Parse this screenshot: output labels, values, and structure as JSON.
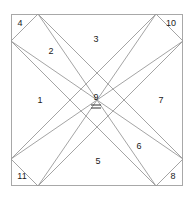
{
  "figure": {
    "background_color": "#ffffff",
    "frame": {
      "stroke_color": "#a8a8a8",
      "fill_color": "#ffffff",
      "x": 11,
      "y": 14,
      "width": 172,
      "height": 172
    },
    "band_stroke_color": "#9a9a9a",
    "label_color": "#1a1a1a"
  },
  "regions": [
    {
      "id": "region-1",
      "label": "1",
      "x": 40,
      "y": 101
    },
    {
      "id": "region-2",
      "label": "2",
      "x": 51,
      "y": 52
    },
    {
      "id": "region-3",
      "label": "3",
      "x": 96,
      "y": 40
    },
    {
      "id": "region-4",
      "label": "4",
      "x": 20,
      "y": 24
    },
    {
      "id": "region-5",
      "label": "5",
      "x": 98,
      "y": 162
    },
    {
      "id": "region-6",
      "label": "6",
      "x": 139,
      "y": 147
    },
    {
      "id": "region-7",
      "label": "7",
      "x": 161,
      "y": 101
    },
    {
      "id": "region-8",
      "label": "8",
      "x": 173,
      "y": 177
    },
    {
      "id": "region-9",
      "label": "9",
      "x": 96,
      "y": 98
    },
    {
      "id": "region-10",
      "label": "10",
      "x": 171,
      "y": 24
    },
    {
      "id": "region-11",
      "label": "11",
      "x": 22,
      "y": 177
    }
  ],
  "center_marker": {
    "name": "double-underline-under-nine",
    "x": 96,
    "y1": 105,
    "y2": 108,
    "half_width": 5,
    "color": "#1a1a1a"
  },
  "bands": {
    "descending": {
      "name": "band-top-left-to-bottom-right",
      "outline_points": "11,41 38,14 183,159 156,186"
    },
    "ascending": {
      "name": "band-bottom-left-to-top-right",
      "outline_points": "11,159 156,14 183,41 38,186"
    }
  },
  "interior_edges": [
    {
      "name": "edge-descending-upper",
      "x1": 11,
      "y1": 41,
      "x2": 183,
      "y2": 159
    },
    {
      "name": "edge-descending-lower",
      "x1": 38,
      "y1": 14,
      "x2": 156,
      "y2": 186
    },
    {
      "name": "edge-ascending-upper",
      "x1": 11,
      "y1": 159,
      "x2": 183,
      "y2": 41
    },
    {
      "name": "edge-ascending-lower",
      "x1": 38,
      "y1": 186,
      "x2": 156,
      "y2": 14
    }
  ]
}
